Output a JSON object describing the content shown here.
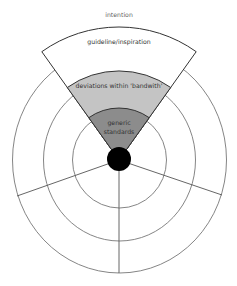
{
  "diagram": {
    "type": "concentric-target-with-wedge",
    "top_label": "intention",
    "center": {
      "x": 119,
      "y": 160
    },
    "rings": [
      {
        "name": "inner",
        "rx": 47,
        "ry": 48
      },
      {
        "name": "middle",
        "rx": 76,
        "ry": 81
      },
      {
        "name": "outer",
        "rx": 107,
        "ry": 113
      }
    ],
    "wedge_bands": [
      {
        "label_lines": [
          "guideline/inspiration"
        ],
        "fill": "#ffffff",
        "outer_radius": 133
      },
      {
        "label_lines": [
          "deviations within 'bandwith'"
        ],
        "fill": "#c4c4c4",
        "outer_radius": 89
      },
      {
        "label_lines": [
          "generic",
          "standards"
        ],
        "fill": "#8c8c8c",
        "outer_radius": 52
      }
    ],
    "center_dot": {
      "radius": 12,
      "fill": "#000000"
    },
    "colors": {
      "ring_stroke": "#777777",
      "wedge_stroke": "#333333",
      "label_text": "#333333",
      "top_label_text": "#666666"
    }
  }
}
